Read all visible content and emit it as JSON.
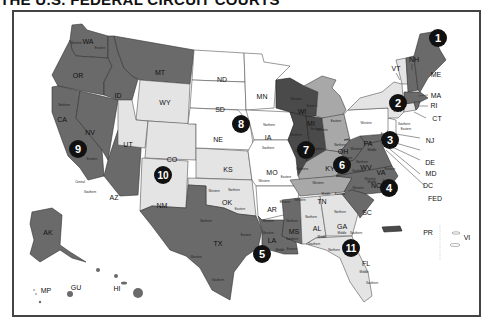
{
  "title": "THE U.S. FEDERAL CIRCUIT COURTS",
  "colors": {
    "circuit_dark": "#6a6a6a",
    "circuit_darker": "#4a4a4a",
    "circuit_mid": "#a8a8a8",
    "circuit_light": "#e4e4e4",
    "circuit_white": "#ffffff",
    "marker": "#111111",
    "border": "#444444"
  },
  "circuits": [
    {
      "number": "1",
      "states": [
        "ME",
        "NH",
        "MA",
        "RI"
      ],
      "shade": "dark"
    },
    {
      "number": "2",
      "states": [
        "VT",
        "NY",
        "CT"
      ],
      "shade": "light"
    },
    {
      "number": "3",
      "states": [
        "PA",
        "NJ",
        "DE"
      ],
      "shade": "white"
    },
    {
      "number": "4",
      "states": [
        "MD",
        "WV",
        "VA",
        "NC",
        "SC"
      ],
      "shade": "dark"
    },
    {
      "number": "5",
      "states": [
        "TX",
        "LA",
        "MS"
      ],
      "shade": "dark"
    },
    {
      "number": "6",
      "states": [
        "MI",
        "OH",
        "KY",
        "TN"
      ],
      "shade": "mid"
    },
    {
      "number": "7",
      "states": [
        "WI",
        "IL",
        "IN"
      ],
      "shade": "darker"
    },
    {
      "number": "8",
      "states": [
        "ND",
        "SD",
        "NE",
        "MN",
        "IA",
        "MO",
        "AR"
      ],
      "shade": "white"
    },
    {
      "number": "9",
      "states": [
        "WA",
        "OR",
        "CA",
        "NV",
        "ID",
        "MT",
        "AZ",
        "AK",
        "HI",
        "GU",
        "MP"
      ],
      "shade": "dark"
    },
    {
      "number": "10",
      "states": [
        "WY",
        "UT",
        "CO",
        "KS",
        "OK",
        "NM"
      ],
      "shade": "light"
    },
    {
      "number": "11",
      "states": [
        "AL",
        "GA",
        "FL"
      ],
      "shade": "light"
    }
  ],
  "state_labels": {
    "WA": "WA",
    "OR": "OR",
    "CA": "CA",
    "NV": "NV",
    "ID": "ID",
    "MT": "MT",
    "AZ": "AZ",
    "WY": "WY",
    "UT": "UT",
    "CO": "CO",
    "NM": "NM",
    "KS": "KS",
    "OK": "OK",
    "ND": "ND",
    "SD": "SD",
    "NE": "NE",
    "MN": "MN",
    "IA": "IA",
    "MO": "MO",
    "AR": "AR",
    "TX": "TX",
    "LA": "LA",
    "MS": "MS",
    "WI": "WI",
    "IL": "IL",
    "IN": "IN",
    "MI": "MI",
    "OH": "OH",
    "KY": "KY",
    "TN": "TN",
    "AL": "AL",
    "GA": "GA",
    "FL": "FL",
    "SC": "SC",
    "NC": "NC",
    "VA": "VA",
    "WV": "WV",
    "PA": "PA",
    "NY": "NY",
    "VT": "VT",
    "NH": "NH",
    "ME": "ME",
    "MA": "MA",
    "RI": "RI",
    "CT": "CT",
    "NJ": "NJ",
    "DE": "DE",
    "MD": "MD",
    "DC": "DC",
    "FED": "FED",
    "AK": "AK",
    "HI": "HI",
    "GU": "GU",
    "MP": "MP",
    "PR": "PR",
    "VI": "VI"
  },
  "district_labels": {
    "wa_w": "Western",
    "wa_e": "Eastern",
    "ca_n": "Northern",
    "ca_e": "Eastern",
    "ca_c": "Central",
    "ca_s": "Southern",
    "ia_n": "Northern",
    "ia_s": "Southern",
    "mo_w": "Western",
    "mo_e": "Eastern",
    "ok_w": "Western",
    "ok_n": "Northern",
    "ok_e": "Eastern",
    "ar_w": "Western",
    "ar_e": "Eastern",
    "tx_n": "Northern",
    "tx_w": "Western",
    "tx_e": "Eastern",
    "tx_s": "Southern",
    "la_w": "Western",
    "la_m": "Middle",
    "la_e": "Eastern",
    "ms_n": "Northern",
    "ms_s": "Southern",
    "mi_w": "Western",
    "mi_e": "Eastern",
    "oh_n": "Northern",
    "oh_s": "Southern",
    "ky_w": "Western",
    "ky_e": "Eastern",
    "tn_w": "Western",
    "tn_m": "Middle",
    "tn_e": "Eastern",
    "al_n": "Northern",
    "al_m": "Middle",
    "al_s": "Southern",
    "ga_n": "Northern",
    "ga_m": "Middle",
    "ga_s": "Southern",
    "fl_n": "Northern",
    "fl_m": "Middle",
    "fl_s": "Southern",
    "pa_w": "Western",
    "pa_m": "Middle",
    "pa_e": "Eastern",
    "ny_w": "Western",
    "ny_n": "Northern",
    "ny_e": "Eastern",
    "ny_s": "Southern",
    "wv_n": "Northern",
    "wv_s": "Southern",
    "va_w": "Western",
    "va_e": "Eastern",
    "nc_w": "Western",
    "nc_m": "Middle",
    "nc_e": "Eastern",
    "wi_w": "Western",
    "wi_e": "Eastern",
    "il_n": "Northern",
    "il_c": "Central",
    "il_s": "Southern",
    "in_n": "Northern",
    "in_s": "Southern"
  },
  "markers": [
    "1",
    "2",
    "3",
    "4",
    "5",
    "6",
    "7",
    "8",
    "9",
    "10",
    "11"
  ]
}
